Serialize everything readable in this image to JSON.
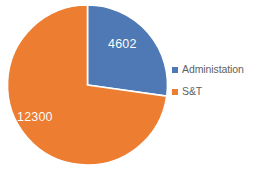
{
  "chart_data": {
    "type": "pie",
    "title": "",
    "subtitle": "",
    "xlabel": "",
    "ylabel": "",
    "grid": false,
    "legend_position": "right",
    "categories": [
      "Administation",
      "S&T"
    ],
    "values": [
      4602,
      12300
    ],
    "data_labels": [
      "4602",
      "12300"
    ],
    "percentages": [
      27.2,
      72.8
    ],
    "total": 16902,
    "start_angle_deg": 0,
    "direction": "clockwise",
    "colors": [
      "#4F79B5",
      "#ED7D31"
    ],
    "slice_border_color": "#FFFFFF",
    "data_label_color": "#FFFFFF",
    "background": "#FFFFFF",
    "slices": [
      {
        "label": "Administation",
        "value": 4602,
        "data_label": "4602",
        "percent": 27.2,
        "color": "#4F79B5"
      },
      {
        "label": "S&T",
        "value": 12300,
        "data_label": "12300",
        "percent": 72.8,
        "color": "#ED7D31"
      }
    ]
  },
  "legend": {
    "items": [
      {
        "label": "Administation",
        "color": "#4F79B5",
        "swatch_name": "legend-swatch-administation"
      },
      {
        "label": "S&T",
        "color": "#ED7D31",
        "swatch_name": "legend-swatch-st"
      }
    ],
    "text_color": "#5F5F5F"
  },
  "geometry": {
    "center_x": 87.5,
    "center_y": 85,
    "radius": 80
  }
}
